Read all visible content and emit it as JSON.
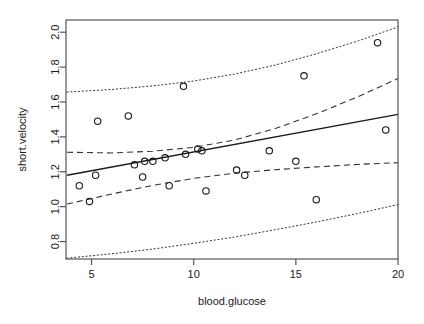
{
  "chart_data": {
    "type": "scatter",
    "title": "",
    "xlabel": "blood.glucose",
    "ylabel": "short.velocity",
    "xlim": [
      3.75,
      20.0
    ],
    "ylim": [
      0.7,
      2.07
    ],
    "xticks": [
      5,
      10,
      15,
      20
    ],
    "yticks": [
      0.8,
      1.0,
      1.2,
      1.4,
      1.6,
      1.8,
      2.0
    ],
    "xtick_labels": [
      "5",
      "10",
      "15",
      "20"
    ],
    "ytick_labels": [
      "0.8",
      "1.0",
      "1.2",
      "1.4",
      "1.6",
      "1.8",
      "2.0"
    ],
    "grid": false,
    "legend": "none",
    "points": [
      {
        "x": 4.4,
        "y": 1.12
      },
      {
        "x": 4.9,
        "y": 1.03
      },
      {
        "x": 5.2,
        "y": 1.18
      },
      {
        "x": 5.3,
        "y": 1.49
      },
      {
        "x": 6.8,
        "y": 1.52
      },
      {
        "x": 7.1,
        "y": 1.24
      },
      {
        "x": 7.5,
        "y": 1.17
      },
      {
        "x": 7.6,
        "y": 1.26
      },
      {
        "x": 8.0,
        "y": 1.26
      },
      {
        "x": 8.6,
        "y": 1.28
      },
      {
        "x": 8.8,
        "y": 1.12
      },
      {
        "x": 9.5,
        "y": 1.69
      },
      {
        "x": 9.6,
        "y": 1.3
      },
      {
        "x": 10.2,
        "y": 1.33
      },
      {
        "x": 10.4,
        "y": 1.32
      },
      {
        "x": 10.6,
        "y": 1.09
      },
      {
        "x": 12.1,
        "y": 1.21
      },
      {
        "x": 12.5,
        "y": 1.18
      },
      {
        "x": 13.7,
        "y": 1.32
      },
      {
        "x": 15.0,
        "y": 1.26
      },
      {
        "x": 15.4,
        "y": 1.75
      },
      {
        "x": 16.0,
        "y": 1.04
      },
      {
        "x": 19.0,
        "y": 1.94
      },
      {
        "x": 19.4,
        "y": 1.44
      }
    ],
    "fit_line": {
      "name": "regression-line",
      "style": "solid",
      "intercept": 1.0978,
      "slope": 0.02158,
      "x_start": 3.8,
      "x_end": 20.0,
      "y_start": 1.18,
      "y_end": 1.529
    },
    "confidence_band": {
      "name": "confidence-interval",
      "style": "dashed",
      "upper": [
        {
          "x": 3.8,
          "y": 1.312
        },
        {
          "x": 6.0,
          "y": 1.308
        },
        {
          "x": 8.0,
          "y": 1.318
        },
        {
          "x": 10.0,
          "y": 1.34
        },
        {
          "x": 12.0,
          "y": 1.382
        },
        {
          "x": 14.0,
          "y": 1.448
        },
        {
          "x": 16.0,
          "y": 1.532
        },
        {
          "x": 18.0,
          "y": 1.628
        },
        {
          "x": 20.0,
          "y": 1.734
        }
      ],
      "lower": [
        {
          "x": 3.8,
          "y": 1.015
        },
        {
          "x": 6.0,
          "y": 1.073
        },
        {
          "x": 8.0,
          "y": 1.122
        },
        {
          "x": 10.0,
          "y": 1.162
        },
        {
          "x": 12.0,
          "y": 1.192
        },
        {
          "x": 14.0,
          "y": 1.212
        },
        {
          "x": 16.0,
          "y": 1.228
        },
        {
          "x": 18.0,
          "y": 1.242
        },
        {
          "x": 20.0,
          "y": 1.252
        }
      ]
    },
    "prediction_band": {
      "name": "prediction-interval",
      "style": "dotted",
      "upper": [
        {
          "x": 3.8,
          "y": 1.657
        },
        {
          "x": 6.0,
          "y": 1.672
        },
        {
          "x": 8.0,
          "y": 1.692
        },
        {
          "x": 10.0,
          "y": 1.72
        },
        {
          "x": 12.0,
          "y": 1.76
        },
        {
          "x": 14.0,
          "y": 1.812
        },
        {
          "x": 16.0,
          "y": 1.876
        },
        {
          "x": 18.0,
          "y": 1.948
        },
        {
          "x": 20.0,
          "y": 2.03
        }
      ],
      "lower": [
        {
          "x": 3.8,
          "y": 0.705
        },
        {
          "x": 6.0,
          "y": 0.73
        },
        {
          "x": 8.0,
          "y": 0.757
        },
        {
          "x": 10.0,
          "y": 0.79
        },
        {
          "x": 12.0,
          "y": 0.826
        },
        {
          "x": 14.0,
          "y": 0.868
        },
        {
          "x": 16.0,
          "y": 0.912
        },
        {
          "x": 18.0,
          "y": 0.96
        },
        {
          "x": 20.0,
          "y": 1.012
        }
      ]
    }
  }
}
